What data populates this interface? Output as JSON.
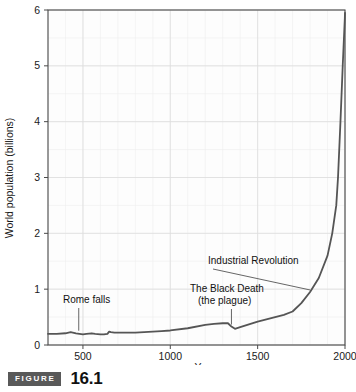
{
  "figure": {
    "badge_label": "FIGURE",
    "number": "16.1"
  },
  "chart_data": {
    "type": "line",
    "title": "",
    "xlabel": "Year",
    "ylabel": "World population (billions)",
    "xlim": [
      300,
      2000
    ],
    "ylim": [
      0,
      6
    ],
    "xticks": [
      500,
      1000,
      1500,
      2000
    ],
    "xtick_labels": [
      "500",
      "1000",
      "1500",
      "2000"
    ],
    "yticks": [
      0,
      1,
      2,
      3,
      4,
      5,
      6
    ],
    "ytick_labels": [
      "0",
      "1",
      "2",
      "3",
      "4",
      "5",
      "6"
    ],
    "grid": true,
    "grid_minor": true,
    "legend": "none",
    "line_color": "#555555",
    "series": [
      {
        "name": "World population",
        "x": [
          300,
          350,
          400,
          430,
          460,
          480,
          500,
          520,
          550,
          570,
          600,
          620,
          640,
          650,
          660,
          680,
          700,
          750,
          800,
          850,
          900,
          950,
          1000,
          1100,
          1200,
          1250,
          1300,
          1330,
          1350,
          1370,
          1400,
          1450,
          1500,
          1550,
          1600,
          1650,
          1700,
          1750,
          1800,
          1850,
          1900,
          1927,
          1950,
          1960,
          1974,
          1987,
          1999,
          2000
        ],
        "y": [
          0.2,
          0.2,
          0.21,
          0.23,
          0.21,
          0.2,
          0.19,
          0.2,
          0.21,
          0.2,
          0.19,
          0.19,
          0.2,
          0.24,
          0.23,
          0.22,
          0.22,
          0.22,
          0.22,
          0.23,
          0.24,
          0.25,
          0.26,
          0.3,
          0.36,
          0.38,
          0.39,
          0.39,
          0.33,
          0.29,
          0.32,
          0.37,
          0.42,
          0.46,
          0.5,
          0.54,
          0.6,
          0.75,
          0.95,
          1.2,
          1.6,
          2.0,
          2.5,
          3.0,
          4.0,
          5.0,
          5.85,
          5.95
        ]
      }
    ],
    "annotations": [
      {
        "name": "rome-falls",
        "text": "Rome falls",
        "lines": [
          "Rome falls"
        ],
        "year": 476,
        "value": 0.22
      },
      {
        "name": "black-death",
        "text": "The Black Death (the plague)",
        "lines": [
          "The Black Death",
          "(the plague)"
        ],
        "year": 1350,
        "value": 0.33
      },
      {
        "name": "industrial-revolution",
        "text": "Industrial Revolution",
        "lines": [
          "Industrial Revolution"
        ],
        "year": 1800,
        "value": 0.95
      }
    ]
  }
}
